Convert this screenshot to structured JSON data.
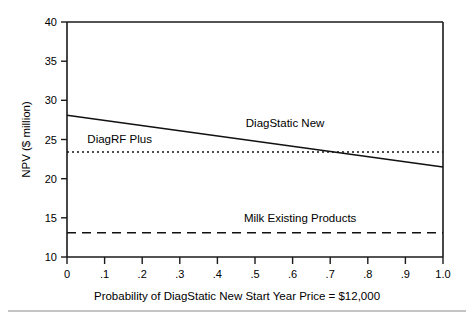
{
  "chart_data": {
    "type": "line",
    "title": "",
    "xlabel": "Probability of DiagStatic New Start Year Price = $12,000",
    "ylabel": "NPV ($ million)",
    "xlim": [
      0,
      1.0
    ],
    "ylim": [
      10,
      40
    ],
    "grid": false,
    "legend_position": "inline-annotations",
    "x_tick_labels": [
      "0",
      ".1",
      ".2",
      ".3",
      ".4",
      ".5",
      ".6",
      ".7",
      ".8",
      ".9",
      "1.0"
    ],
    "x_ticks": [
      0,
      0.1,
      0.2,
      0.3,
      0.4,
      0.5,
      0.6,
      0.7,
      0.8,
      0.9,
      1.0
    ],
    "y_tick_labels": [
      "10",
      "15",
      "20",
      "25",
      "30",
      "35",
      "40"
    ],
    "y_ticks": [
      10,
      15,
      20,
      25,
      30,
      35,
      40
    ],
    "series": [
      {
        "name": "DiagStatic New",
        "style": "solid",
        "x": [
          0,
          1.0
        ],
        "values": [
          28.1,
          21.5
        ],
        "label": "DiagStatic New",
        "label_x": 0.58,
        "label_y": 26.6
      },
      {
        "name": "DiagRF Plus",
        "style": "dotted",
        "x": [
          0,
          1.0
        ],
        "values": [
          23.4,
          23.4
        ],
        "label": "DiagRF Plus",
        "label_x": 0.14,
        "label_y": 24.5
      },
      {
        "name": "Milk Existing Products",
        "style": "dashed",
        "x": [
          0,
          1.0
        ],
        "values": [
          13.1,
          13.1
        ],
        "label": "Milk Existing Products",
        "label_x": 0.62,
        "label_y": 14.5
      }
    ],
    "annotations": [
      {
        "text": "DiagStatic New"
      },
      {
        "text": "DiagRF Plus"
      },
      {
        "text": "Milk Existing Products"
      }
    ],
    "colors": {
      "line": "#111111",
      "axis": "#1a1a1a",
      "background": "#ffffff",
      "footer_rule": "#8a8a8a"
    }
  }
}
